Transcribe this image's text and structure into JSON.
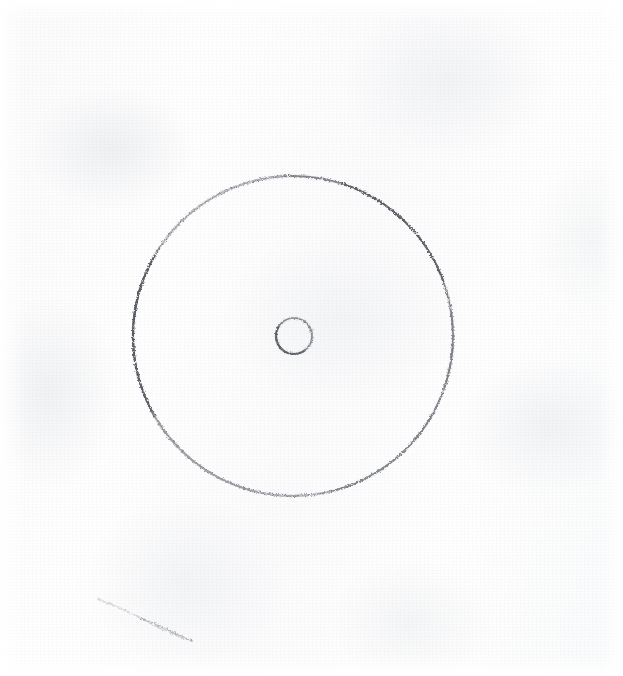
{
  "image": {
    "kind": "scanned-pencil-drawing",
    "title": "Hand-drawn circle with small centre circle",
    "medium": "graphite pencil on textured white paper",
    "width": 623,
    "height": 676,
    "background_color": "#fdfdfd",
    "paper_tone_color": "#f7f8f9",
    "stroke_color": "#7c7f85",
    "stroke_color_dark": "#5a5d63",
    "stroke_color_faint": "#c3c6cb"
  },
  "marks": [
    {
      "name": "outer-circle",
      "shape": "circle",
      "center_x": 293,
      "center_y": 336,
      "radius": 160,
      "stroke_quality": "rough, granular, broken; darkest on the left and upper-right arcs, faintest on the upper-left and bottom arcs",
      "stroke_width": 1.6
    },
    {
      "name": "center-circle",
      "shape": "circle",
      "center_x": 294,
      "center_y": 336,
      "radius": 18,
      "stroke_quality": "small rough loop, darkest along the lower-left edge",
      "stroke_width": 1.4
    },
    {
      "name": "stray-mark",
      "shape": "line",
      "x1": 98,
      "y1": 599,
      "x2": 192,
      "y2": 641,
      "stroke_quality": "very faint broken diagonal smudge in the lower-left of the sheet",
      "stroke_width": 1.2
    }
  ]
}
